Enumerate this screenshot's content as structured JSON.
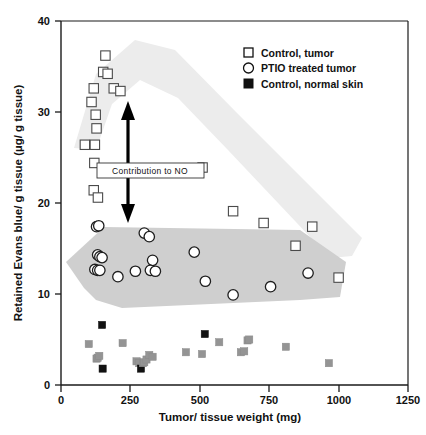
{
  "chart_data": {
    "type": "scatter",
    "title": "",
    "xlabel": "Tumor/ tissue weight (mg)",
    "ylabel": "Retained Evans blue/ g tissue (µg/ g tissue)",
    "xlim": [
      0,
      1250
    ],
    "ylim": [
      0,
      40
    ],
    "xticks": [
      "0",
      "250",
      "500",
      "750",
      "1000",
      "1250"
    ],
    "xtick_values": [
      0,
      250,
      500,
      750,
      1000,
      1250
    ],
    "yticks": [
      "0",
      "10",
      "20",
      "30",
      "40"
    ],
    "ytick_values": [
      0,
      10,
      20,
      30,
      40
    ],
    "grid": false,
    "legend_position": "top-right",
    "series": [
      {
        "name": "Control, tumor",
        "marker": "open-square",
        "color": "#4a4a4a",
        "points": [
          [
            86,
            26.4
          ],
          [
            110,
            31.1
          ],
          [
            118,
            32.6
          ],
          [
            122,
            26.4
          ],
          [
            125,
            29.7
          ],
          [
            128,
            28.2
          ],
          [
            120,
            24.4
          ],
          [
            118,
            21.4
          ],
          [
            133,
            20.6
          ],
          [
            152,
            34.4
          ],
          [
            160,
            36.2
          ],
          [
            168,
            34.2
          ],
          [
            190,
            32.6
          ],
          [
            214,
            32.3
          ],
          [
            510,
            23.9
          ],
          [
            620,
            19.1
          ],
          [
            730,
            17.8
          ],
          [
            845,
            15.3
          ],
          [
            905,
            17.4
          ],
          [
            1000,
            11.8
          ]
        ]
      },
      {
        "name": "PTIO treated tumor",
        "marker": "open-circle",
        "color": "#1e1e1e",
        "points": [
          [
            128,
            17.4
          ],
          [
            136,
            17.5
          ],
          [
            132,
            14.3
          ],
          [
            140,
            14.1
          ],
          [
            148,
            14.0
          ],
          [
            122,
            12.7
          ],
          [
            132,
            12.6
          ],
          [
            140,
            12.6
          ],
          [
            205,
            11.9
          ],
          [
            268,
            12.5
          ],
          [
            300,
            16.7
          ],
          [
            318,
            16.3
          ],
          [
            330,
            13.7
          ],
          [
            322,
            12.6
          ],
          [
            340,
            12.5
          ],
          [
            480,
            14.6
          ],
          [
            520,
            11.4
          ],
          [
            620,
            9.9
          ],
          [
            755,
            10.8
          ],
          [
            890,
            12.3
          ]
        ]
      },
      {
        "name": "Control, normal skin",
        "marker": "filled-square",
        "color": "#111111",
        "points": [
          [
            100,
            4.5
          ],
          [
            128,
            2.9
          ],
          [
            132,
            3.0
          ],
          [
            138,
            3.2
          ],
          [
            148,
            6.6
          ],
          [
            150,
            1.8
          ],
          [
            222,
            4.6
          ],
          [
            272,
            2.6
          ],
          [
            282,
            2.4
          ],
          [
            288,
            1.8
          ],
          [
            295,
            2.4
          ],
          [
            300,
            2.5
          ],
          [
            308,
            2.8
          ],
          [
            318,
            3.3
          ],
          [
            330,
            3.1
          ],
          [
            450,
            3.6
          ],
          [
            508,
            3.4
          ],
          [
            518,
            5.6
          ],
          [
            570,
            4.7
          ],
          [
            648,
            3.6
          ],
          [
            660,
            3.7
          ],
          [
            672,
            4.9
          ],
          [
            678,
            5.0
          ],
          [
            810,
            4.2
          ],
          [
            965,
            2.4
          ]
        ]
      }
    ],
    "annotations": [
      {
        "text": "Contribution to NO",
        "type": "label-box",
        "x": 290,
        "y": 22.1
      },
      {
        "type": "double-arrow",
        "x": 235,
        "y_start": 19.0,
        "y_end": 30.6
      }
    ],
    "bands": [
      {
        "name": "control-tumor-trend-band",
        "color": "#ececec"
      },
      {
        "name": "ptio-tumor-trend-band",
        "color": "#cfcfcf"
      }
    ]
  },
  "legend": {
    "items": [
      {
        "label": "Control, tumor",
        "marker": "open-square"
      },
      {
        "label": "PTIO treated tumor",
        "marker": "open-circle"
      },
      {
        "label": "Control, normal skin",
        "marker": "filled-square"
      }
    ]
  }
}
